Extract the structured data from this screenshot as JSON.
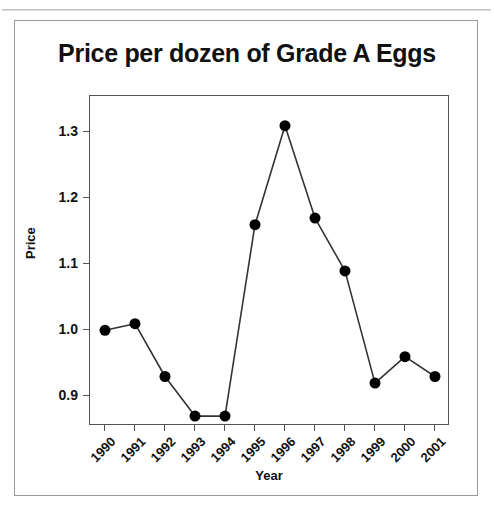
{
  "page": {
    "top_fragment_left": "............",
    "top_fragment_right": "............"
  },
  "chart_data": {
    "type": "line",
    "title": "Price per dozen of Grade A Eggs",
    "xlabel": "Year",
    "ylabel": "Price",
    "categories": [
      "1990",
      "1991",
      "1992",
      "1993",
      "1994",
      "1995",
      "1996",
      "1997",
      "1998",
      "1999",
      "2000",
      "2001"
    ],
    "values": [
      1.0,
      1.01,
      0.93,
      0.87,
      0.87,
      1.16,
      1.31,
      1.17,
      1.09,
      0.92,
      0.96,
      0.93
    ],
    "series": [
      {
        "name": "Price per dozen",
        "values": [
          1.0,
          1.01,
          0.93,
          0.87,
          0.87,
          1.16,
          1.31,
          1.17,
          1.09,
          0.92,
          0.96,
          0.93
        ]
      }
    ],
    "ylim": [
      0.855,
      1.355
    ],
    "y_ticks": [
      0.9,
      1.0,
      1.1,
      1.2,
      1.3
    ],
    "y_tick_labels": [
      "0.9",
      "1.0",
      "1.1",
      "1.2",
      "1.3"
    ],
    "grid": false,
    "legend": false,
    "marker": "filled-circle",
    "marker_color": "#000000",
    "line_color": "#333333"
  }
}
